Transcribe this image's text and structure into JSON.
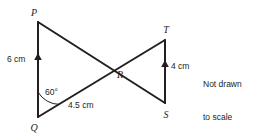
{
  "figure": {
    "note": {
      "line1": "Not drawn",
      "line2": "to scale"
    },
    "stroke_color": "#231f20",
    "vertices": [
      {
        "id": "P",
        "label": "P",
        "x": 38,
        "y": 22,
        "label_x": 34,
        "label_y": 16
      },
      {
        "id": "Q",
        "label": "Q",
        "x": 38,
        "y": 117,
        "label_x": 34,
        "label_y": 131
      },
      {
        "id": "R",
        "label": "R",
        "x": 118,
        "y": 66,
        "label_x": 115,
        "label_y": 77
      },
      {
        "id": "S",
        "label": "S",
        "x": 165,
        "y": 103,
        "label_x": 161,
        "label_y": 117
      },
      {
        "id": "T",
        "label": "T",
        "x": 165,
        "y": 40,
        "label_x": 161,
        "label_y": 33
      }
    ],
    "segments": [
      {
        "id": "PQ",
        "from": "P",
        "to": "Q",
        "x1": 38,
        "y1": 22,
        "x2": 38,
        "y2": 117
      },
      {
        "id": "PS",
        "from": "P",
        "to": "S",
        "x1": 38,
        "y1": 22,
        "x2": 165,
        "y2": 103
      },
      {
        "id": "QT",
        "from": "Q",
        "to": "T",
        "x1": 38,
        "y1": 117,
        "x2": 165,
        "y2": 40
      },
      {
        "id": "TS",
        "from": "T",
        "to": "S",
        "x1": 165,
        "y1": 40,
        "x2": 165,
        "y2": 103
      }
    ],
    "measures": [
      {
        "id": "PQ-length",
        "text": "6 cm",
        "x": 8,
        "y": 63,
        "segment": "PQ"
      },
      {
        "id": "TS-length",
        "text": "4 cm",
        "x": 172,
        "y": 70,
        "segment": "TS"
      },
      {
        "id": "QR-length",
        "text": "4.5 cm",
        "x": 68,
        "y": 108,
        "segment": "QR"
      }
    ],
    "angles": [
      {
        "id": "angle-Q",
        "text": "60°",
        "vertex": "Q",
        "x": 46,
        "y": 95
      }
    ],
    "tick_markers": [
      {
        "id": "PQ-arrow",
        "on": "PQ",
        "x": 38,
        "y": 58,
        "direction": "up"
      },
      {
        "id": "TS-arrow",
        "on": "TS",
        "x": 165,
        "y": 65,
        "direction": "up"
      }
    ]
  }
}
